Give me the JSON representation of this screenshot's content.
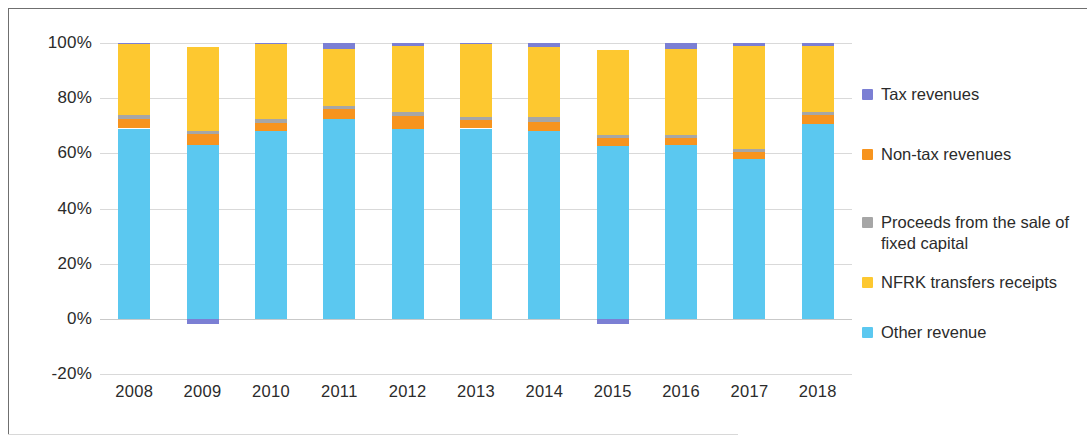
{
  "chart_data": {
    "type": "bar",
    "subtype": "stacked-100-percent",
    "title": "",
    "subtitle": "",
    "xlabel": "",
    "ylabel": "",
    "ylim": [
      -20,
      100
    ],
    "yticks": [
      "-20%",
      "0%",
      "20%",
      "40%",
      "60%",
      "80%",
      "100%"
    ],
    "ytick_values": [
      -20,
      0,
      20,
      40,
      60,
      80,
      100
    ],
    "grid": true,
    "legend_position": "right",
    "categories": [
      "2008",
      "2009",
      "2010",
      "2011",
      "2012",
      "2013",
      "2014",
      "2015",
      "2016",
      "2017",
      "2018"
    ],
    "series": [
      {
        "name": "Other revenue",
        "color": "#5bc8f0",
        "values": [
          69.0,
          63.0,
          68.0,
          72.5,
          69.0,
          69.0,
          68.0,
          62.5,
          63.0,
          58.0,
          70.5
        ]
      },
      {
        "name": "Non-tax revenues",
        "color": "#f7941e",
        "values": [
          3.5,
          4.0,
          3.0,
          3.5,
          4.5,
          3.0,
          3.5,
          3.0,
          2.5,
          2.5,
          3.5
        ]
      },
      {
        "name": "Proceeds from the sale of fixed capital",
        "color": "#a6a6a6",
        "values": [
          1.5,
          1.0,
          1.5,
          1.0,
          1.5,
          1.0,
          1.5,
          1.0,
          1.0,
          1.0,
          1.0
        ]
      },
      {
        "name": "NFRK transfers receipts",
        "color": "#fdc830",
        "values": [
          25.5,
          30.5,
          27.0,
          21.0,
          24.0,
          26.5,
          25.5,
          31.0,
          31.5,
          37.5,
          24.0
        ]
      },
      {
        "name": "Tax revenues",
        "color": "#7b7fd4",
        "values": [
          0.5,
          -2.0,
          0.5,
          2.0,
          1.0,
          0.5,
          1.5,
          -2.0,
          2.0,
          1.0,
          1.0
        ]
      }
    ],
    "stack_order": [
      "Other revenue",
      "Non-tax revenues",
      "Proceeds from the sale of fixed capital",
      "NFRK transfers receipts",
      "Tax revenues"
    ]
  },
  "legend": {
    "items": [
      {
        "label": "Tax revenues",
        "color": "#7b7fd4"
      },
      {
        "label": "Non-tax revenues",
        "color": "#f7941e"
      },
      {
        "label": "Proceeds from the sale of\nfixed capital",
        "color": "#a6a6a6"
      },
      {
        "label": "NFRK transfers receipts",
        "color": "#fdc830"
      },
      {
        "label": "Other revenue",
        "color": "#5bc8f0"
      }
    ]
  }
}
